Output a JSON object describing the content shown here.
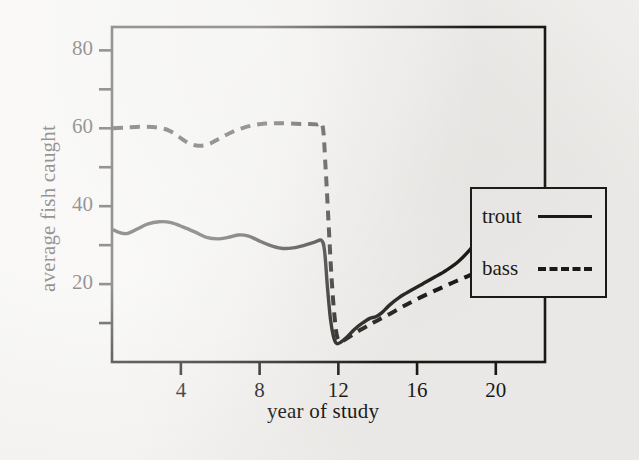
{
  "chart_data": {
    "type": "line",
    "title": "",
    "xlabel": "year of study",
    "ylabel": "average fish caught",
    "xlim": [
      0.5,
      22.5
    ],
    "ylim": [
      0,
      86
    ],
    "grid": false,
    "legend_position": "right-inside-overhanging",
    "xticks": [
      4,
      8,
      12,
      16,
      20
    ],
    "xtick_labels": [
      "4",
      "8",
      "12",
      "16",
      "20"
    ],
    "xminor_ticks": [
      2,
      6,
      10,
      14,
      18,
      22
    ],
    "yticks": [
      20,
      40,
      60,
      80
    ],
    "ytick_labels": [
      "20",
      "40",
      "60",
      "80"
    ],
    "yminor_ticks": [
      10,
      30,
      50,
      70
    ],
    "series": [
      {
        "name": "trout",
        "style": "solid",
        "color": "#14110f",
        "x": [
          0.55,
          0.9,
          1.3,
          1.8,
          2.3,
          2.9,
          3.5,
          4.1,
          4.7,
          5.3,
          5.9,
          6.4,
          6.9,
          7.4,
          7.9,
          8.5,
          9.1,
          9.7,
          10.3,
          10.8,
          11.15,
          11.3,
          11.45,
          11.6,
          11.75,
          11.9,
          12.1,
          12.4,
          12.8,
          13.2,
          13.6,
          13.9,
          14.2,
          14.6,
          15.1,
          15.7,
          16.3,
          16.9,
          17.5,
          18.1,
          18.7,
          19.2,
          19.7,
          20.0
        ],
        "y": [
          34.0,
          33.2,
          33.0,
          34.2,
          35.4,
          36.0,
          35.8,
          34.7,
          33.4,
          32.0,
          31.6,
          32.0,
          32.6,
          32.4,
          31.3,
          30.0,
          29.2,
          29.3,
          30.0,
          30.8,
          31.2,
          28.5,
          19.0,
          11.0,
          6.6,
          4.8,
          5.0,
          6.2,
          8.3,
          9.9,
          11.2,
          11.6,
          12.6,
          14.6,
          16.6,
          18.4,
          20.1,
          21.8,
          23.6,
          25.8,
          28.9,
          32.2,
          35.2,
          36.8
        ]
      },
      {
        "name": "bass",
        "style": "dashed",
        "color": "#14110f",
        "x": [
          0.55,
          1.2,
          2.0,
          2.8,
          3.4,
          3.9,
          4.4,
          4.9,
          5.4,
          5.9,
          6.5,
          7.1,
          7.7,
          8.3,
          8.9,
          9.6,
          10.3,
          10.9,
          11.2,
          11.35,
          11.5,
          11.65,
          11.8,
          11.95,
          12.2,
          12.6,
          13.1,
          13.6,
          14.1,
          14.7,
          15.3,
          15.9,
          16.6,
          17.3,
          18.0,
          18.7,
          19.4,
          20.0
        ],
        "y": [
          60.0,
          60.2,
          60.4,
          60.2,
          59.4,
          57.8,
          56.2,
          55.5,
          55.9,
          57.2,
          58.8,
          60.0,
          60.8,
          61.2,
          61.3,
          61.2,
          61.1,
          61.0,
          60.6,
          50.0,
          36.0,
          22.0,
          12.0,
          6.3,
          5.4,
          6.6,
          8.2,
          9.6,
          11.0,
          12.6,
          14.3,
          15.9,
          17.6,
          19.2,
          20.8,
          22.3,
          23.8,
          25.0
        ]
      }
    ],
    "annotations": {
      "event": "population crash between year 11 and 12 for both species"
    }
  },
  "legend": {
    "entries": [
      {
        "label": "trout",
        "style": "solid"
      },
      {
        "label": "bass",
        "style": "dashed"
      }
    ]
  },
  "colors": {
    "ink": "#14110f",
    "paper": "#f2f1ef"
  }
}
